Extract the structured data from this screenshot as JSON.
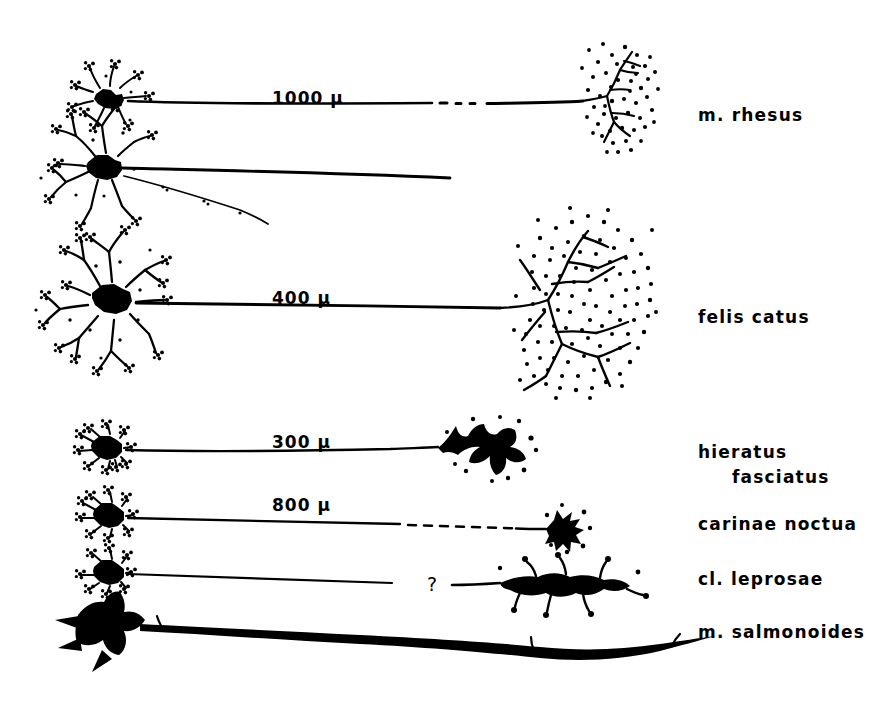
{
  "figure": {
    "type": "comparative-neuroanatomy-diagram",
    "background_color": "#ffffff",
    "ink_color": "#000000"
  },
  "rows": [
    {
      "id": "row-rhesus",
      "species_label": "m. rhesus",
      "scale_label": "1000 μ",
      "soma_style": "small stellate neuron with radiating beaded dendrites",
      "axon_style": "long straight axon with dashed interruption",
      "terminal_style": "branched arborization within dense stippled bouton field"
    },
    {
      "id": "row-rhesus-second",
      "species_label": "",
      "scale_label": "",
      "soma_style": "large multipolar neuron with beaded dendritic tufts",
      "axon_style": "main axon plus descending collateral branch",
      "terminal_style": "none shown"
    },
    {
      "id": "row-felis-catus",
      "species_label": "felis catus",
      "scale_label": "400 μ",
      "soma_style": "large multipolar neuron with radiating beaded dendrites",
      "axon_style": "long straight axon",
      "terminal_style": "very large branched arborization within very dense stippled bouton field"
    },
    {
      "id": "row-hieratus-fasciatus",
      "species_label_line1": "hieratus",
      "species_label_line2": "fasciatus",
      "scale_label": "300 μ",
      "soma_style": "small compact stellate neuron",
      "axon_style": "long thin axon",
      "terminal_style": "solid black splayed calyceal ending"
    },
    {
      "id": "row-carinae-noctua",
      "species_label": "carinae    noctua",
      "scale_label": "800 μ",
      "soma_style": "small compact stellate neuron",
      "axon_style": "long thin axon with dashed interruption",
      "terminal_style": "small solid black stellate ending"
    },
    {
      "id": "row-cl-leprosae",
      "species_label": "cl. leprosae",
      "scale_label": "?",
      "soma_style": "small compact stellate neuron",
      "axon_style": "thin axon of unknown length",
      "terminal_style": "elongated solid black ending with short knobbed appendages"
    },
    {
      "id": "row-m-salmonoides",
      "species_label": "m. salmonoides",
      "scale_label": "",
      "soma_style": "large solid black lobed soma",
      "axon_style": "thick undulating club ending",
      "terminal_style": "thick solid black elongated club ending"
    }
  ],
  "scale_labels": [
    {
      "text": "1000 μ",
      "x": 272,
      "y": 88
    },
    {
      "text": "400 μ",
      "x": 272,
      "y": 288
    },
    {
      "text": "300 μ",
      "x": 272,
      "y": 432
    },
    {
      "text": "800 μ",
      "x": 272,
      "y": 495
    }
  ],
  "unknown_marker": {
    "text": "?",
    "x": 427,
    "y": 573
  },
  "species_labels": [
    {
      "text": "m. rhesus",
      "x": 698,
      "y": 103
    },
    {
      "text": "felis catus",
      "x": 698,
      "y": 305
    },
    {
      "line1": "hieratus",
      "line2": "fasciatus",
      "x": 698,
      "y": 440
    },
    {
      "text": "carinae   noctua",
      "x": 698,
      "y": 512
    },
    {
      "text": "cl. leprosae",
      "x": 698,
      "y": 567
    },
    {
      "text": "m. salmonoides",
      "x": 698,
      "y": 620
    }
  ]
}
